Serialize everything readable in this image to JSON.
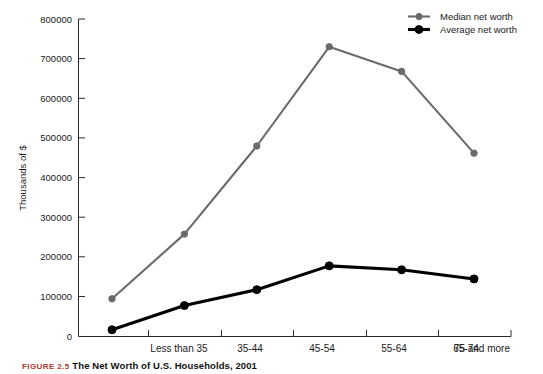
{
  "chart_data": {
    "type": "line",
    "title": "",
    "xlabel": "",
    "ylabel": "Thousands of $",
    "ylim": [
      0,
      800000
    ],
    "yticks": [
      "0",
      "100000",
      "200000",
      "300000",
      "400000",
      "500000",
      "600000",
      "700000",
      "800000"
    ],
    "grid": false,
    "legend_position": "top-right",
    "categories": [
      "Less than 35",
      "35-44",
      "45-54",
      "55-64",
      "65-74",
      "75 and more"
    ],
    "series": [
      {
        "name": "Median net worth",
        "color": "#6a6a6a",
        "marker": "circle",
        "values": [
          95000,
          258000,
          480000,
          730000,
          668000,
          462000
        ]
      },
      {
        "name": "Average net worth",
        "color": "#000000",
        "marker": "circle",
        "values": [
          17000,
          78000,
          118000,
          178000,
          168000,
          145000
        ]
      }
    ]
  },
  "caption": {
    "number": "FIGURE 2.5",
    "text": "The Net Worth of U.S. Households, 2001"
  }
}
